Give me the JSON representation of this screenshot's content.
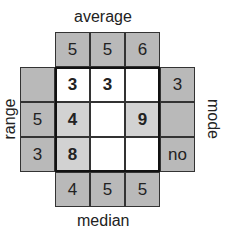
{
  "labels": {
    "top": "average",
    "bottom": "median",
    "left": "range",
    "right": "mode"
  },
  "top_clues": [
    "5",
    "5",
    "6"
  ],
  "bottom_clues": [
    "4",
    "5",
    "5"
  ],
  "left_clues": [
    "",
    "5",
    "3"
  ],
  "right_clues": [
    "3",
    "",
    "no"
  ],
  "grid": [
    [
      {
        "v": "3",
        "given": false
      },
      {
        "v": "3",
        "given": false
      },
      {
        "v": "",
        "given": false
      }
    ],
    [
      {
        "v": "4",
        "given": true
      },
      {
        "v": "",
        "given": false
      },
      {
        "v": "9",
        "given": true
      }
    ],
    [
      {
        "v": "8",
        "given": true
      },
      {
        "v": "",
        "given": false
      },
      {
        "v": "",
        "given": false
      }
    ]
  ],
  "colors": {
    "outer": "#b9b9b9",
    "given": "#d2d2d2",
    "blank": "#ffffff"
  }
}
